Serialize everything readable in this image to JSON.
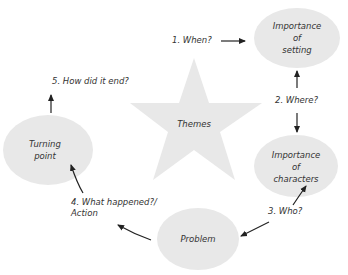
{
  "diagram": {
    "center": {
      "label": "Themes",
      "shape": "star"
    },
    "nodes": [
      {
        "id": "setting",
        "label_line1": "Importance of",
        "label_line2": "setting"
      },
      {
        "id": "characters",
        "label_line1": "Importance of",
        "label_line2": "characters"
      },
      {
        "id": "problem",
        "label_line1": "Problem",
        "label_line2": ""
      },
      {
        "id": "turning",
        "label_line1": "Turning",
        "label_line2": "point"
      }
    ],
    "edges": [
      {
        "label": "1. When?"
      },
      {
        "label": "2. Where?"
      },
      {
        "label": "3. Who?"
      },
      {
        "label_line1": "4. What happened?/",
        "label_line2": "Action"
      },
      {
        "label": "5. How did it end?"
      }
    ],
    "colors": {
      "shape_fill": "#e8e8e8",
      "arrow": "#222222",
      "text": "#333333"
    }
  }
}
